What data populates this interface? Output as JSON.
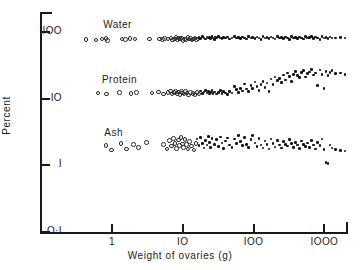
{
  "chart_data": {
    "type": "scatter",
    "title": "",
    "xlabel": "Weight of ovaries  (g)",
    "ylabel": "Percent",
    "xscale": "log",
    "yscale": "log",
    "xlim": [
      0.3,
      2200
    ],
    "ylim": [
      0.1,
      200
    ],
    "grid": false,
    "legend_position": "inline-annotations",
    "xticks": [
      {
        "value": 1,
        "label": "1"
      },
      {
        "value": 10,
        "label": "IO"
      },
      {
        "value": 100,
        "label": "IOO"
      },
      {
        "value": 1000,
        "label": "IOOO"
      }
    ],
    "yticks": [
      {
        "value": 0.1,
        "label": "O·I"
      },
      {
        "value": 1,
        "label": "I"
      },
      {
        "value": 10,
        "label": "IO"
      },
      {
        "value": 100,
        "label": "IOO"
      }
    ],
    "annotations": [
      {
        "text": "Water",
        "x": 0.75,
        "y": 125
      },
      {
        "text": "Protein",
        "x": 0.72,
        "y": 19
      },
      {
        "text": "Ash",
        "x": 0.78,
        "y": 3.1
      }
    ],
    "marker_styles": {
      "open": "open circle - smaller ovaries",
      "filled": "filled dot - larger ovaries"
    },
    "series": [
      {
        "name": "Water",
        "points_open": [
          [
            0.42,
            79
          ],
          [
            0.58,
            78
          ],
          [
            0.7,
            80
          ],
          [
            0.8,
            82
          ],
          [
            0.84,
            77
          ],
          [
            1.35,
            80
          ],
          [
            1.5,
            79
          ],
          [
            1.75,
            82
          ],
          [
            2.05,
            81
          ],
          [
            3.3,
            80
          ],
          [
            4.6,
            81
          ],
          [
            5.0,
            79
          ],
          [
            5.4,
            82
          ],
          [
            6.0,
            80
          ],
          [
            6.6,
            83
          ],
          [
            7.0,
            78
          ],
          [
            7.4,
            81
          ],
          [
            7.8,
            84
          ],
          [
            8.2,
            79
          ],
          [
            8.6,
            82
          ],
          [
            9.0,
            80
          ],
          [
            9.4,
            83
          ],
          [
            9.8,
            77
          ],
          [
            10.2,
            81
          ],
          [
            10.8,
            79
          ],
          [
            11.5,
            84
          ],
          [
            12.0,
            80
          ],
          [
            12.6,
            82
          ],
          [
            13.2,
            78
          ],
          [
            13.8,
            81
          ],
          [
            14.5,
            83
          ],
          [
            15.2,
            79
          ],
          [
            16.0,
            80
          ]
        ],
        "points_filled": [
          [
            17,
            82
          ],
          [
            18,
            79
          ],
          [
            19,
            84
          ],
          [
            20,
            81
          ],
          [
            21,
            78
          ],
          [
            22,
            83
          ],
          [
            23,
            80
          ],
          [
            24,
            82
          ],
          [
            25,
            79
          ],
          [
            26,
            85
          ],
          [
            27,
            81
          ],
          [
            28,
            77
          ],
          [
            29,
            83
          ],
          [
            30,
            80
          ],
          [
            32,
            84
          ],
          [
            34,
            81
          ],
          [
            36,
            79
          ],
          [
            38,
            82
          ],
          [
            40,
            80
          ],
          [
            43,
            83
          ],
          [
            46,
            78
          ],
          [
            50,
            81
          ],
          [
            54,
            84
          ],
          [
            58,
            80
          ],
          [
            62,
            82
          ],
          [
            66,
            79
          ],
          [
            70,
            83
          ],
          [
            75,
            81
          ],
          [
            80,
            78
          ],
          [
            86,
            84
          ],
          [
            92,
            80
          ],
          [
            98,
            82
          ],
          [
            105,
            79
          ],
          [
            112,
            83
          ],
          [
            120,
            81
          ],
          [
            128,
            77
          ],
          [
            137,
            84
          ],
          [
            146,
            80
          ],
          [
            156,
            82
          ],
          [
            167,
            79
          ],
          [
            178,
            83
          ],
          [
            190,
            81
          ],
          [
            203,
            78
          ],
          [
            217,
            84
          ],
          [
            232,
            80
          ],
          [
            248,
            82
          ],
          [
            265,
            79
          ],
          [
            283,
            83
          ],
          [
            302,
            81
          ],
          [
            323,
            77
          ],
          [
            345,
            84
          ],
          [
            368,
            80
          ],
          [
            393,
            82
          ],
          [
            420,
            79
          ],
          [
            448,
            83
          ],
          [
            479,
            81
          ],
          [
            512,
            78
          ],
          [
            547,
            84
          ],
          [
            584,
            80
          ],
          [
            624,
            82
          ],
          [
            667,
            85
          ],
          [
            712,
            79
          ],
          [
            760,
            83
          ],
          [
            812,
            81
          ],
          [
            867,
            77
          ],
          [
            926,
            84
          ],
          [
            989,
            80
          ],
          [
            1056,
            82
          ],
          [
            1128,
            79
          ],
          [
            1205,
            83
          ],
          [
            1287,
            81
          ],
          [
            1450,
            80
          ],
          [
            1700,
            82
          ],
          [
            1980,
            81
          ]
        ]
      },
      {
        "name": "Protein",
        "points_open": [
          [
            0.62,
            12.5
          ],
          [
            0.82,
            12.0
          ],
          [
            1.25,
            12.8
          ],
          [
            1.8,
            12.2
          ],
          [
            2.15,
            12.6
          ],
          [
            3.6,
            12.4
          ],
          [
            4.4,
            12.9
          ],
          [
            5.2,
            12.1
          ],
          [
            6.0,
            12.6
          ],
          [
            6.5,
            13.4
          ],
          [
            6.9,
            12.0
          ],
          [
            7.3,
            12.8
          ],
          [
            7.7,
            13.1
          ],
          [
            8.1,
            12.3
          ],
          [
            8.5,
            12.9
          ],
          [
            8.9,
            11.8
          ],
          [
            9.3,
            13.2
          ],
          [
            9.7,
            12.5
          ],
          [
            10.1,
            12.0
          ],
          [
            10.6,
            13.0
          ],
          [
            11.2,
            12.4
          ],
          [
            11.8,
            11.7
          ],
          [
            12.5,
            12.8
          ],
          [
            13.5,
            12.2
          ],
          [
            14.5,
            11.9
          ],
          [
            15.5,
            12.6
          ],
          [
            16.5,
            12.1
          ]
        ],
        "points_filled": [
          [
            18,
            12.9
          ],
          [
            19,
            11.8
          ],
          [
            20,
            12.4
          ],
          [
            21,
            13.2
          ],
          [
            22,
            12.0
          ],
          [
            23,
            12.7
          ],
          [
            24,
            11.6
          ],
          [
            25,
            12.3
          ],
          [
            26,
            13.0
          ],
          [
            27,
            11.9
          ],
          [
            28,
            12.5
          ],
          [
            30,
            11.7
          ],
          [
            32,
            12.2
          ],
          [
            34,
            13.1
          ],
          [
            36,
            11.8
          ],
          [
            38,
            12.6
          ],
          [
            40,
            12.0
          ],
          [
            43,
            11.5
          ],
          [
            46,
            12.8
          ],
          [
            50,
            12.1
          ],
          [
            54,
            15.0
          ],
          [
            58,
            13.5
          ],
          [
            62,
            12.3
          ],
          [
            66,
            14.2
          ],
          [
            70,
            12.9
          ],
          [
            75,
            16.5
          ],
          [
            80,
            13.8
          ],
          [
            86,
            12.6
          ],
          [
            92,
            15.5
          ],
          [
            98,
            14.0
          ],
          [
            105,
            17.5
          ],
          [
            112,
            15.0
          ],
          [
            120,
            13.2
          ],
          [
            128,
            16.0
          ],
          [
            137,
            18.0
          ],
          [
            146,
            14.5
          ],
          [
            156,
            17.0
          ],
          [
            167,
            12.8
          ],
          [
            178,
            19.5
          ],
          [
            190,
            16.2
          ],
          [
            203,
            21.0
          ],
          [
            217,
            18.5
          ],
          [
            232,
            20.0
          ],
          [
            248,
            17.2
          ],
          [
            265,
            22.5
          ],
          [
            283,
            19.0
          ],
          [
            302,
            24.0
          ],
          [
            323,
            21.5
          ],
          [
            345,
            18.0
          ],
          [
            368,
            23.0
          ],
          [
            393,
            25.5
          ],
          [
            420,
            22.0
          ],
          [
            448,
            20.5
          ],
          [
            479,
            24.5
          ],
          [
            512,
            26.0
          ],
          [
            547,
            21.0
          ],
          [
            584,
            23.5
          ],
          [
            624,
            25.0
          ],
          [
            667,
            27.0
          ],
          [
            712,
            22.5
          ],
          [
            760,
            24.0
          ],
          [
            812,
            15.5
          ],
          [
            867,
            26.5
          ],
          [
            926,
            23.0
          ],
          [
            989,
            14.0
          ],
          [
            1056,
            25.5
          ],
          [
            1128,
            22.0
          ],
          [
            1205,
            24.5
          ],
          [
            1287,
            26.0
          ],
          [
            1450,
            23.5
          ],
          [
            1700,
            24.0
          ],
          [
            1980,
            23.0
          ]
        ]
      },
      {
        "name": "Ash",
        "points_open": [
          [
            0.8,
            2.05
          ],
          [
            0.95,
            1.75
          ],
          [
            1.3,
            2.2
          ],
          [
            1.55,
            1.8
          ],
          [
            1.95,
            2.1
          ],
          [
            2.3,
            1.9
          ],
          [
            3.0,
            2.25
          ],
          [
            5.2,
            2.1
          ],
          [
            5.8,
            1.8
          ],
          [
            6.3,
            2.4
          ],
          [
            6.8,
            2.0
          ],
          [
            7.2,
            2.6
          ],
          [
            7.6,
            2.2
          ],
          [
            8.0,
            1.85
          ],
          [
            8.4,
            2.45
          ],
          [
            8.8,
            2.05
          ],
          [
            9.2,
            2.7
          ],
          [
            9.6,
            2.15
          ],
          [
            10.0,
            1.9
          ],
          [
            10.5,
            2.5
          ],
          [
            11.0,
            2.1
          ],
          [
            11.6,
            1.8
          ],
          [
            12.2,
            2.35
          ],
          [
            13.0,
            2.0
          ],
          [
            14.0,
            1.75
          ],
          [
            15.0,
            2.2
          ]
        ],
        "points_filled": [
          [
            16,
            2.45
          ],
          [
            17,
            1.95
          ],
          [
            18,
            2.6
          ],
          [
            19,
            2.1
          ],
          [
            20,
            1.8
          ],
          [
            21,
            2.35
          ],
          [
            22,
            2.0
          ],
          [
            23,
            2.7
          ],
          [
            24,
            2.2
          ],
          [
            25,
            1.85
          ],
          [
            26,
            2.5
          ],
          [
            28,
            2.05
          ],
          [
            30,
            2.4
          ],
          [
            32,
            1.9
          ],
          [
            34,
            2.65
          ],
          [
            36,
            2.15
          ],
          [
            38,
            1.78
          ],
          [
            40,
            2.3
          ],
          [
            43,
            2.55
          ],
          [
            46,
            2.0
          ],
          [
            50,
            1.82
          ],
          [
            54,
            2.45
          ],
          [
            58,
            2.1
          ],
          [
            62,
            2.75
          ],
          [
            66,
            2.25
          ],
          [
            70,
            1.95
          ],
          [
            75,
            2.6
          ],
          [
            80,
            2.05
          ],
          [
            86,
            1.85
          ],
          [
            92,
            2.4
          ],
          [
            98,
            2.8
          ],
          [
            105,
            2.15
          ],
          [
            112,
            1.9
          ],
          [
            120,
            2.5
          ],
          [
            128,
            2.0
          ],
          [
            137,
            1.8
          ],
          [
            146,
            2.3
          ],
          [
            156,
            2.05
          ],
          [
            167,
            1.75
          ],
          [
            178,
            2.45
          ],
          [
            190,
            2.1
          ],
          [
            203,
            1.88
          ],
          [
            217,
            2.35
          ],
          [
            232,
            2.0
          ],
          [
            248,
            1.8
          ],
          [
            265,
            2.25
          ],
          [
            283,
            2.05
          ],
          [
            302,
            1.92
          ],
          [
            323,
            2.4
          ],
          [
            345,
            2.1
          ],
          [
            368,
            1.85
          ],
          [
            393,
            2.2
          ],
          [
            420,
            2.0
          ],
          [
            448,
            1.78
          ],
          [
            479,
            2.3
          ],
          [
            512,
            2.05
          ],
          [
            547,
            1.9
          ],
          [
            584,
            2.15
          ],
          [
            624,
            1.82
          ],
          [
            667,
            2.35
          ],
          [
            712,
            2.0
          ],
          [
            760,
            1.75
          ],
          [
            812,
            2.2
          ],
          [
            867,
            1.95
          ],
          [
            926,
            2.45
          ],
          [
            989,
            1.7
          ],
          [
            1056,
            1.1
          ],
          [
            1128,
            1.05
          ],
          [
            1205,
            2.0
          ],
          [
            1287,
            1.8
          ],
          [
            1450,
            1.7
          ],
          [
            1700,
            1.65
          ],
          [
            1980,
            1.62
          ]
        ]
      }
    ]
  }
}
